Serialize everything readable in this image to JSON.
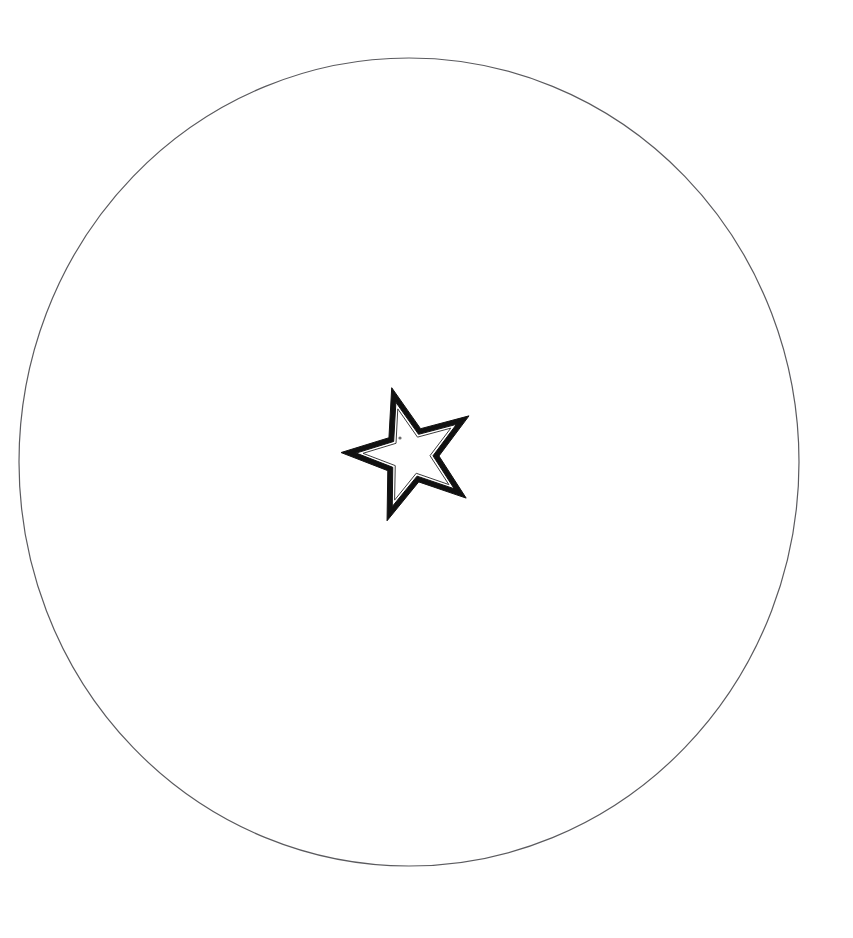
{
  "canvas": {
    "width": 853,
    "height": 938,
    "background_color": "#ffffff",
    "title": "Star inside circle line drawing"
  },
  "colors": {
    "background": "#ffffff",
    "circle_stroke": "#5a5a5e",
    "star_band_fill": "#111111",
    "star_inner_fill": "#ffffff",
    "star_inner_stroke": "#3a3a3a",
    "dot_fill": "#6b6b6b"
  },
  "shapes": {
    "circle": {
      "name": "outer-circle",
      "type": "ellipse",
      "center_x": 409,
      "center_y": 462,
      "radius_x": 390,
      "radius_y": 404,
      "stroke_width": 1.2,
      "fill": "none",
      "label": "Outer circle"
    },
    "star_outer": {
      "name": "star-outer-band",
      "type": "star",
      "points": 5,
      "center_x": 411,
      "center_y": 455,
      "outer_radius": 70,
      "inner_radius": 28,
      "rotation_deg": -16,
      "band_thickness": 8,
      "label": "Outer star band"
    },
    "star_inner": {
      "name": "star-inner-outline",
      "type": "star",
      "points": 5,
      "center_x": 411,
      "center_y": 455,
      "outer_radius": 48,
      "inner_radius": 19,
      "rotation_deg": -16,
      "stroke_width": 1,
      "label": "Inner star outline"
    },
    "dot": {
      "name": "center-dot",
      "type": "circle",
      "center_x": 400,
      "center_y": 438,
      "radius": 1.6,
      "label": "Small dot mark"
    }
  },
  "extents": {
    "circle_left_x": 19,
    "circle_right_x": 799,
    "circle_top_y": 58,
    "circle_bottom_y": 866,
    "star_top_point": {
      "x": 378,
      "y": 388
    },
    "star_left_point": {
      "x": 344,
      "y": 452
    },
    "star_right_point": {
      "x": 478,
      "y": 466
    },
    "star_bottom_point": {
      "x": 410,
      "y": 525
    }
  },
  "accessibility": {
    "alt_text": "A large thin hand-drawn circle on a white background with a small five-pointed star outlined in thick black near the center",
    "caption": ""
  }
}
